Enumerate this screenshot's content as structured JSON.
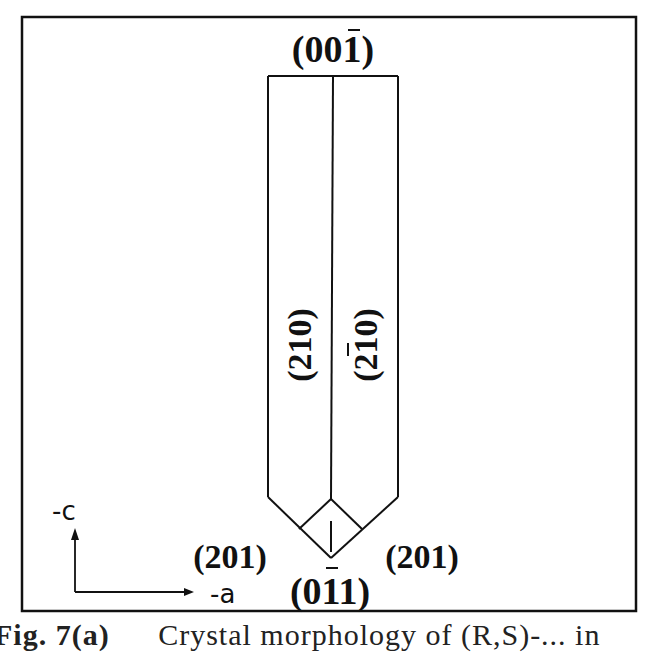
{
  "figure": {
    "top_face_label": "(001)",
    "top_face_bar_index": 2,
    "left_prism_face_label": "(210)",
    "right_prism_face_label": "(210)",
    "right_prism_face_bar_index": 1,
    "left_cap_face_label": "(201)",
    "right_cap_face_label": "(201)",
    "bottom_face_label": "(011)",
    "bottom_face_bar_index": 1,
    "axes": {
      "vertical_label": "-c",
      "horizontal_label": "-a"
    },
    "colors": {
      "line": "#111111",
      "background": "#ffffff"
    }
  },
  "caption": {
    "figure_number": "Fig. 7(a)",
    "text": "Crystal morphology of (R,S)-... in"
  }
}
